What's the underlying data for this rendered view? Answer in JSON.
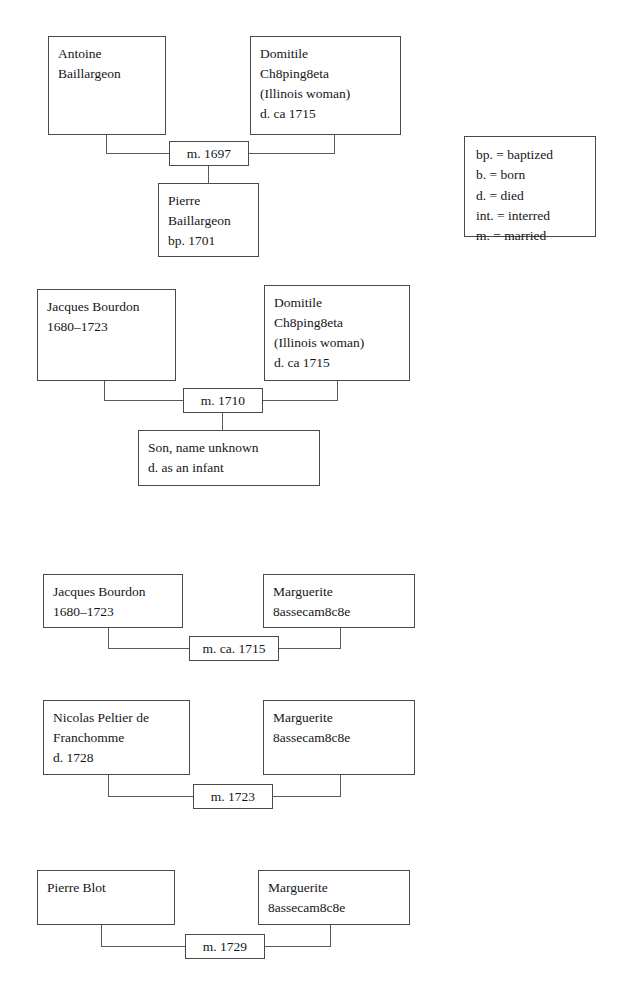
{
  "document": {
    "type": "genealogy-chart",
    "title": "Family relationship diagram"
  },
  "legend": {
    "name": "abbreviation-legend",
    "lines": [
      "bp. = baptized",
      "b. = born",
      "d. = died",
      "int. = interred",
      "m. = married"
    ]
  },
  "families": [
    {
      "id": "family-1",
      "father": {
        "lines": [
          "Antoine",
          "Baillargeon"
        ]
      },
      "mother": {
        "lines": [
          "Domitile",
          "Ch8ping8eta",
          "(Illinois woman)",
          "d. ca 1715"
        ]
      },
      "marriage": "m. 1697",
      "child": {
        "lines": [
          "Pierre",
          "Baillargeon",
          "bp. 1701"
        ]
      }
    },
    {
      "id": "family-2",
      "father": {
        "lines": [
          "Jacques Bourdon",
          "1680–1723"
        ]
      },
      "mother": {
        "lines": [
          "Domitile",
          "Ch8ping8eta",
          "(Illinois woman)",
          "d. ca 1715"
        ]
      },
      "marriage": "m. 1710",
      "child": {
        "lines": [
          "Son, name unknown",
          "d. as an infant"
        ]
      }
    },
    {
      "id": "family-3",
      "father": {
        "lines": [
          "Jacques Bourdon",
          "1680–1723"
        ]
      },
      "mother": {
        "lines": [
          "Marguerite",
          "8assecam8c8e"
        ]
      },
      "marriage": "m. ca. 1715",
      "child": null
    },
    {
      "id": "family-4",
      "father": {
        "lines": [
          "Nicolas Peltier de",
          "Franchomme",
          "d. 1728"
        ]
      },
      "mother": {
        "lines": [
          "Marguerite",
          "8assecam8c8e"
        ]
      },
      "marriage": "m. 1723",
      "child": null
    },
    {
      "id": "family-5",
      "father": {
        "lines": [
          "Pierre Blot"
        ]
      },
      "mother": {
        "lines": [
          "Marguerite",
          "8assecam8c8e"
        ]
      },
      "marriage": "m. 1729",
      "child": null
    }
  ],
  "colors": {
    "box_border": "#4a4a4a",
    "connector": "#5a5a5a",
    "text": "#15161a",
    "background": "#ffffff"
  }
}
